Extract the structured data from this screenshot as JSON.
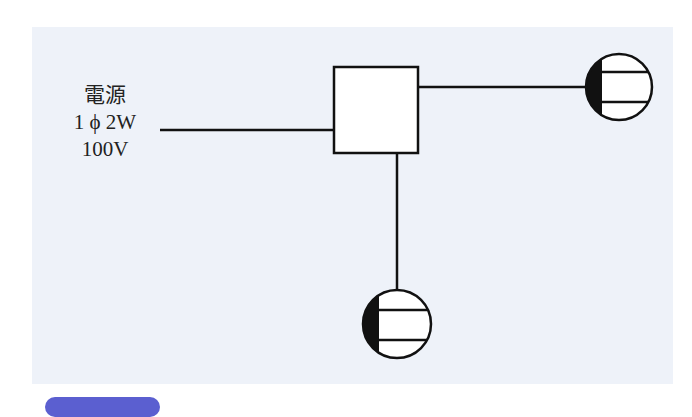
{
  "diagram": {
    "power_source": {
      "line1": "電源",
      "line2": "1 ϕ 2W",
      "line3": "100V"
    },
    "components": [
      {
        "type": "junction-box",
        "shape": "square"
      },
      {
        "type": "lamp-fixture",
        "position": "right"
      },
      {
        "type": "lamp-fixture",
        "position": "bottom"
      }
    ],
    "colors": {
      "background": "#eef2f9",
      "stroke": "#111111",
      "badge": "#5b5fd0"
    }
  }
}
